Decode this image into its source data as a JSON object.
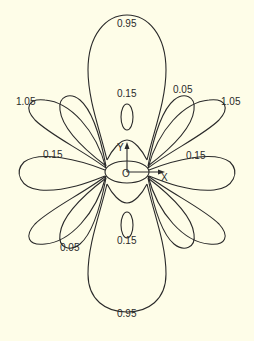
{
  "diagram": {
    "type": "polar-lobe contour plot",
    "background": "#fefde8",
    "stroke_color": "#2a2a2a",
    "origin_label": "O",
    "axes": {
      "x_label": "X",
      "y_label": "Y"
    },
    "labels": {
      "top_lobe": "0.95",
      "bottom_lobe": "0.95",
      "top_inner": "0.15",
      "bottom_inner": "0.15",
      "upper_left_outer": "1.05",
      "upper_right_outer": "1.05",
      "upper_right_mid": "0.05",
      "lower_left_mid": "0.05",
      "left_horizontal": "0.15",
      "right_horizontal": "0.15"
    }
  }
}
